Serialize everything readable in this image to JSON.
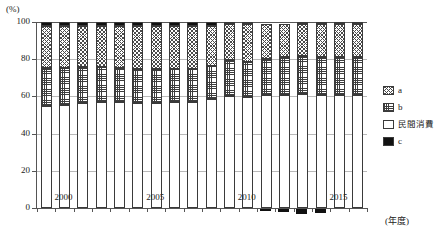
{
  "axis": {
    "y_unit": "(%)",
    "y_ticks": [
      0,
      20,
      40,
      60,
      80,
      100
    ],
    "x_unit": "(年度)",
    "x_ticklabels": [
      "2000",
      "2005",
      "2010",
      "2015"
    ],
    "x_tickyears": [
      2000,
      2005,
      2010,
      2015
    ]
  },
  "legend": {
    "items": [
      {
        "key": "a",
        "label": "a",
        "pattern": "diagonal-crosshatch",
        "color": "#4a4a4a"
      },
      {
        "key": "b",
        "label": "b",
        "pattern": "square-grid",
        "color": "#3d3d3d"
      },
      {
        "key": "consumption",
        "label": "民間消費",
        "pattern": "solid-white",
        "color": "#ffffff"
      },
      {
        "key": "c",
        "label": "c",
        "pattern": "solid-black",
        "color": "#111111"
      }
    ]
  },
  "chart_data": {
    "type": "bar",
    "stacked": true,
    "title": "",
    "xlabel": "(年度)",
    "ylabel": "(%)",
    "ylim": [
      -5,
      100
    ],
    "grid": true,
    "legend_position": "right",
    "categories": [
      1999,
      2000,
      2001,
      2002,
      2003,
      2004,
      2005,
      2006,
      2007,
      2008,
      2009,
      2010,
      2011,
      2012,
      2013,
      2014,
      2015,
      2016
    ],
    "series": [
      {
        "name": "民間消費",
        "key": "consumption",
        "values": [
          55.0,
          55.5,
          56.5,
          57.0,
          57.0,
          56.5,
          56.5,
          57.0,
          57.0,
          58.5,
          60.0,
          59.5,
          60.5,
          61.0,
          61.5,
          61.0,
          61.0,
          61.0
        ]
      },
      {
        "name": "b",
        "key": "b",
        "values": [
          20.5,
          20.0,
          19.5,
          19.0,
          18.5,
          18.0,
          18.0,
          18.0,
          18.0,
          18.0,
          19.5,
          19.0,
          19.5,
          20.0,
          20.0,
          20.0,
          20.0,
          20.0
        ]
      },
      {
        "name": "a",
        "key": "a",
        "values": [
          22.5,
          22.5,
          22.0,
          22.0,
          22.5,
          23.5,
          23.5,
          23.0,
          23.0,
          21.5,
          19.5,
          20.5,
          19.0,
          18.0,
          17.5,
          18.0,
          18.0,
          18.0
        ]
      },
      {
        "name": "c",
        "key": "c",
        "values": [
          2.0,
          2.0,
          2.0,
          2.0,
          2.0,
          2.0,
          2.0,
          2.0,
          2.0,
          2.0,
          1.0,
          1.0,
          0.0,
          0.0,
          1.0,
          1.0,
          1.0,
          1.0
        ]
      }
    ],
    "negative_series": {
      "name": "c",
      "key": "c",
      "values": [
        0,
        0,
        0,
        0,
        0,
        0,
        0,
        0,
        0,
        0,
        0,
        0,
        -1.2,
        -1.6,
        -2.8,
        -2.0,
        0,
        0
      ]
    }
  }
}
